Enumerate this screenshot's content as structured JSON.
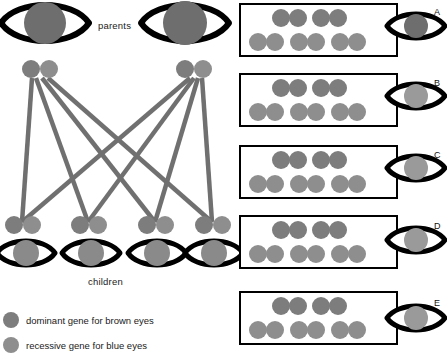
{
  "figure": {
    "labels": {
      "parents": "parents",
      "children": "children"
    },
    "legend": [
      {
        "marker": "gene-dot-dominant",
        "text": "dominant gene for brown eyes",
        "color": "#7f7f7f"
      },
      {
        "marker": "gene-dot-recessive",
        "text": "recessive gene for blue eyes",
        "color": "#8c8c8c"
      }
    ],
    "colors": {
      "outline": "#000000",
      "gene_dominant": "#7d7d7d",
      "gene_recessive": "#8e8e8e",
      "iris_brown": "#6e6e6e",
      "iris_blue": "#9a9a9a",
      "line": "#707070",
      "box_border": "#000000",
      "background": "#ffffff"
    },
    "pedigree": {
      "parents": [
        {
          "id": "parent-left",
          "eye": "brown",
          "genes": [
            "dominant",
            "recessive"
          ]
        },
        {
          "id": "parent-right",
          "eye": "brown",
          "genes": [
            "dominant",
            "recessive"
          ]
        }
      ],
      "children": [
        {
          "id": "child-1",
          "eye": "brown",
          "genes": [
            "dominant",
            "recessive"
          ]
        },
        {
          "id": "child-2",
          "eye": "brown",
          "genes": [
            "dominant",
            "recessive"
          ]
        },
        {
          "id": "child-3",
          "eye": "brown",
          "genes": [
            "dominant",
            "recessive"
          ]
        },
        {
          "id": "child-4",
          "eye": "brown",
          "genes": [
            "dominant",
            "recessive"
          ]
        }
      ],
      "connector_count": 8
    },
    "options": [
      {
        "letter": "A",
        "eye": "brown",
        "rows": [
          {
            "pairs": 2
          },
          {
            "pairs": 3
          }
        ]
      },
      {
        "letter": "B",
        "eye": "blue",
        "rows": [
          {
            "pairs": 2
          },
          {
            "pairs": 3
          }
        ]
      },
      {
        "letter": "C",
        "eye": "blue",
        "rows": [
          {
            "pairs": 2
          },
          {
            "pairs": 3
          }
        ]
      },
      {
        "letter": "D",
        "eye": "blue",
        "rows": [
          {
            "pairs": 2
          },
          {
            "pairs": 3
          }
        ]
      },
      {
        "letter": "E",
        "eye": "blue",
        "rows": [
          {
            "pairs": 2
          },
          {
            "pairs": 3
          }
        ]
      }
    ]
  }
}
